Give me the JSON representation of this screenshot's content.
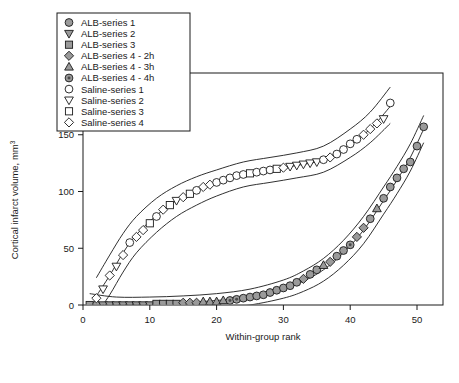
{
  "figure": {
    "background": "#ffffff",
    "frame_color": "#1a1a1a"
  },
  "axes": {
    "xlabel": "Within-group rank",
    "ylabel_main": "Cortical infarct volume, mm",
    "ylabel_sup": "3",
    "x_ticks": [
      "0",
      "10",
      "20",
      "30",
      "40",
      "50"
    ],
    "y_ticks": [
      "0",
      "50",
      "100",
      "150",
      "200"
    ]
  },
  "legend": {
    "items": [
      {
        "label": "ALB-series 1",
        "marker": "circle",
        "fill": "#9a9a9a"
      },
      {
        "label": "ALB-series 2",
        "marker": "triangle-down",
        "fill": "#9a9a9a"
      },
      {
        "label": "ALB-series 3",
        "marker": "square",
        "fill": "#9a9a9a"
      },
      {
        "label": "ALB-series 4 - 2h",
        "marker": "diamond",
        "fill": "#9a9a9a"
      },
      {
        "label": "ALB-series 4 - 3h",
        "marker": "triangle-up",
        "fill": "#9a9a9a"
      },
      {
        "label": "ALB-series 4 - 4h",
        "marker": "circle-dot",
        "fill": "#9a9a9a"
      },
      {
        "label": "Saline-series 1",
        "marker": "circle",
        "fill": "#ffffff"
      },
      {
        "label": "Saline-series 2",
        "marker": "triangle-down",
        "fill": "#ffffff"
      },
      {
        "label": "Saline-series 3",
        "marker": "square",
        "fill": "#ffffff"
      },
      {
        "label": "Saline-series 4",
        "marker": "diamond",
        "fill": "#ffffff"
      }
    ]
  },
  "chart_data": {
    "type": "scatter",
    "title": "",
    "xlabel": "Within-group rank",
    "ylabel": "Cortical infarct volume, mm^3",
    "xlim": [
      -3,
      56
    ],
    "ylim": [
      -18,
      222
    ],
    "grid": false,
    "legend_position": "top-left",
    "series": [
      {
        "name": "ALB",
        "marker_fill": "#9a9a9a",
        "points": [
          {
            "x": 1,
            "y": 0,
            "marker": "square"
          },
          {
            "x": 2,
            "y": 0,
            "marker": "circle"
          },
          {
            "x": 3,
            "y": 0,
            "marker": "triangle-down"
          },
          {
            "x": 4,
            "y": 0,
            "marker": "triangle-down"
          },
          {
            "x": 5,
            "y": 0,
            "marker": "triangle-down"
          },
          {
            "x": 6,
            "y": 0,
            "marker": "triangle-down"
          },
          {
            "x": 7,
            "y": 0,
            "marker": "triangle-down"
          },
          {
            "x": 8,
            "y": 0,
            "marker": "triangle-down"
          },
          {
            "x": 9,
            "y": 0,
            "marker": "triangle-down"
          },
          {
            "x": 10,
            "y": 0,
            "marker": "triangle-down"
          },
          {
            "x": 11,
            "y": 1,
            "marker": "square"
          },
          {
            "x": 12,
            "y": 1,
            "marker": "square"
          },
          {
            "x": 13,
            "y": 1,
            "marker": "square"
          },
          {
            "x": 14,
            "y": 1,
            "marker": "square"
          },
          {
            "x": 15,
            "y": 2,
            "marker": "diamond"
          },
          {
            "x": 16,
            "y": 2,
            "marker": "diamond"
          },
          {
            "x": 17,
            "y": 2,
            "marker": "diamond"
          },
          {
            "x": 18,
            "y": 3,
            "marker": "triangle-up"
          },
          {
            "x": 19,
            "y": 3,
            "marker": "triangle-up"
          },
          {
            "x": 20,
            "y": 3,
            "marker": "triangle-up"
          },
          {
            "x": 21,
            "y": 4,
            "marker": "triangle-up"
          },
          {
            "x": 22,
            "y": 4,
            "marker": "circle-dot"
          },
          {
            "x": 23,
            "y": 5,
            "marker": "circle-dot"
          },
          {
            "x": 24,
            "y": 6,
            "marker": "circle"
          },
          {
            "x": 25,
            "y": 7,
            "marker": "circle"
          },
          {
            "x": 26,
            "y": 8,
            "marker": "circle"
          },
          {
            "x": 27,
            "y": 9,
            "marker": "circle"
          },
          {
            "x": 28,
            "y": 11,
            "marker": "circle"
          },
          {
            "x": 29,
            "y": 13,
            "marker": "circle"
          },
          {
            "x": 30,
            "y": 15,
            "marker": "circle"
          },
          {
            "x": 31,
            "y": 17,
            "marker": "circle"
          },
          {
            "x": 32,
            "y": 20,
            "marker": "circle"
          },
          {
            "x": 33,
            "y": 23,
            "marker": "diamond"
          },
          {
            "x": 34,
            "y": 27,
            "marker": "circle"
          },
          {
            "x": 35,
            "y": 31,
            "marker": "circle"
          },
          {
            "x": 36,
            "y": 35,
            "marker": "triangle-up"
          },
          {
            "x": 37,
            "y": 38,
            "marker": "diamond"
          },
          {
            "x": 38,
            "y": 43,
            "marker": "circle"
          },
          {
            "x": 39,
            "y": 48,
            "marker": "circle"
          },
          {
            "x": 40,
            "y": 53,
            "marker": "circle-dot"
          },
          {
            "x": 41,
            "y": 60,
            "marker": "diamond"
          },
          {
            "x": 42,
            "y": 68,
            "marker": "diamond"
          },
          {
            "x": 43,
            "y": 76,
            "marker": "circle"
          },
          {
            "x": 44,
            "y": 85,
            "marker": "triangle-up"
          },
          {
            "x": 45,
            "y": 94,
            "marker": "circle"
          },
          {
            "x": 46,
            "y": 104,
            "marker": "circle"
          },
          {
            "x": 47,
            "y": 112,
            "marker": "circle"
          },
          {
            "x": 48,
            "y": 120,
            "marker": "circle"
          },
          {
            "x": 49,
            "y": 126,
            "marker": "circle"
          },
          {
            "x": 50,
            "y": 140,
            "marker": "circle"
          },
          {
            "x": 51,
            "y": 157,
            "marker": "circle"
          }
        ]
      },
      {
        "name": "Saline",
        "marker_fill": "#ffffff",
        "points": [
          {
            "x": 2,
            "y": 6,
            "marker": "diamond"
          },
          {
            "x": 3,
            "y": 14,
            "marker": "triangle-down"
          },
          {
            "x": 4,
            "y": 26,
            "marker": "diamond"
          },
          {
            "x": 5,
            "y": 34,
            "marker": "triangle-down"
          },
          {
            "x": 6,
            "y": 44,
            "marker": "diamond"
          },
          {
            "x": 7,
            "y": 55,
            "marker": "circle"
          },
          {
            "x": 8,
            "y": 60,
            "marker": "diamond"
          },
          {
            "x": 9,
            "y": 66,
            "marker": "diamond"
          },
          {
            "x": 10,
            "y": 72,
            "marker": "square"
          },
          {
            "x": 11,
            "y": 78,
            "marker": "circle"
          },
          {
            "x": 12,
            "y": 84,
            "marker": "diamond"
          },
          {
            "x": 13,
            "y": 88,
            "marker": "square"
          },
          {
            "x": 14,
            "y": 92,
            "marker": "triangle-down"
          },
          {
            "x": 15,
            "y": 95,
            "marker": "diamond"
          },
          {
            "x": 16,
            "y": 98,
            "marker": "square"
          },
          {
            "x": 17,
            "y": 101,
            "marker": "circle"
          },
          {
            "x": 18,
            "y": 104,
            "marker": "diamond"
          },
          {
            "x": 19,
            "y": 106,
            "marker": "diamond"
          },
          {
            "x": 20,
            "y": 108,
            "marker": "circle"
          },
          {
            "x": 21,
            "y": 110,
            "marker": "circle"
          },
          {
            "x": 22,
            "y": 112,
            "marker": "circle"
          },
          {
            "x": 23,
            "y": 114,
            "marker": "circle"
          },
          {
            "x": 24,
            "y": 115,
            "marker": "circle"
          },
          {
            "x": 25,
            "y": 116,
            "marker": "square"
          },
          {
            "x": 26,
            "y": 117,
            "marker": "circle"
          },
          {
            "x": 27,
            "y": 118,
            "marker": "circle"
          },
          {
            "x": 28,
            "y": 119,
            "marker": "circle"
          },
          {
            "x": 29,
            "y": 120,
            "marker": "square"
          },
          {
            "x": 30,
            "y": 121,
            "marker": "diamond"
          },
          {
            "x": 31,
            "y": 122,
            "marker": "triangle-down"
          },
          {
            "x": 32,
            "y": 123,
            "marker": "triangle-down"
          },
          {
            "x": 33,
            "y": 124,
            "marker": "triangle-down"
          },
          {
            "x": 34,
            "y": 125,
            "marker": "triangle-down"
          },
          {
            "x": 35,
            "y": 126,
            "marker": "triangle-down"
          },
          {
            "x": 36,
            "y": 128,
            "marker": "circle"
          },
          {
            "x": 37,
            "y": 130,
            "marker": "diamond"
          },
          {
            "x": 38,
            "y": 133,
            "marker": "circle"
          },
          {
            "x": 39,
            "y": 137,
            "marker": "circle"
          },
          {
            "x": 40,
            "y": 142,
            "marker": "circle"
          },
          {
            "x": 41,
            "y": 146,
            "marker": "circle"
          },
          {
            "x": 42,
            "y": 150,
            "marker": "diamond"
          },
          {
            "x": 43,
            "y": 155,
            "marker": "diamond"
          },
          {
            "x": 44,
            "y": 160,
            "marker": "diamond"
          },
          {
            "x": 45,
            "y": 164,
            "marker": "triangle-down"
          },
          {
            "x": 46,
            "y": 178,
            "marker": "circle"
          }
        ]
      }
    ],
    "fit_curves": [
      {
        "name": "ALB-fit",
        "x": [
          1,
          5,
          10,
          15,
          20,
          25,
          30,
          33,
          36,
          39,
          42,
          45,
          47,
          49,
          51
        ],
        "y": [
          0,
          0,
          1,
          2,
          4,
          7,
          14,
          21,
          31,
          46,
          66,
          92,
          110,
          130,
          155
        ]
      },
      {
        "name": "ALB-upper-band",
        "x": [
          1,
          5,
          10,
          15,
          20,
          25,
          30,
          33,
          36,
          39,
          42,
          45,
          47,
          49,
          51
        ],
        "y": [
          10,
          7,
          7,
          8,
          10,
          14,
          22,
          30,
          41,
          57,
          78,
          104,
          122,
          142,
          167
        ]
      },
      {
        "name": "ALB-lower-band",
        "x": [
          1,
          5,
          10,
          15,
          20,
          25,
          30,
          33,
          36,
          39,
          42,
          45,
          47,
          49,
          51
        ],
        "y": [
          -12,
          -8,
          -6,
          -5,
          -3,
          0,
          6,
          12,
          21,
          35,
          54,
          80,
          98,
          118,
          143
        ]
      },
      {
        "name": "Saline-fit",
        "x": [
          2,
          4,
          6,
          8,
          11,
          14,
          17,
          20,
          24,
          28,
          32,
          36,
          40,
          43,
          46
        ],
        "y": [
          8,
          26,
          46,
          62,
          79,
          92,
          101,
          108,
          115,
          119,
          123,
          128,
          142,
          155,
          175
        ]
      },
      {
        "name": "Saline-upper-band",
        "x": [
          2,
          4,
          6,
          8,
          11,
          14,
          17,
          20,
          24,
          28,
          32,
          36,
          40,
          43,
          46
        ],
        "y": [
          24,
          44,
          63,
          78,
          94,
          105,
          113,
          119,
          126,
          130,
          134,
          140,
          155,
          170,
          192
        ]
      },
      {
        "name": "Saline-lower-band",
        "x": [
          2,
          4,
          6,
          8,
          11,
          14,
          17,
          20,
          24,
          28,
          32,
          36,
          40,
          43,
          46
        ],
        "y": [
          -8,
          9,
          29,
          46,
          64,
          78,
          88,
          96,
          104,
          108,
          112,
          117,
          130,
          143,
          160
        ]
      }
    ]
  }
}
